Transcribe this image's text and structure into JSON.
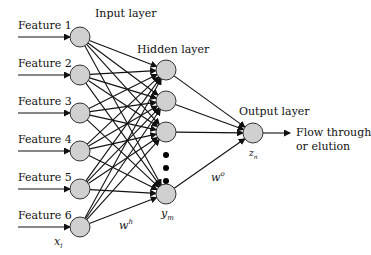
{
  "layers": {
    "input": {
      "title": "Input layer",
      "var": "x",
      "var_sub": "i"
    },
    "hidden": {
      "title": "Hidden layer",
      "var": "y",
      "var_sub": "m"
    },
    "output": {
      "title": "Output layer",
      "var": "z",
      "var_sub": "n"
    }
  },
  "features": [
    "Feature 1",
    "Feature 2",
    "Feature 3",
    "Feature 4",
    "Feature 5",
    "Feature 6"
  ],
  "weights": {
    "hidden": "w",
    "hidden_sup": "h",
    "output": "w",
    "output_sup": "o"
  },
  "output_label": {
    "line1": "Flow through",
    "line2": "or elution"
  },
  "colors": {
    "node_fill": "#d0d0d0",
    "line": "#111111"
  }
}
